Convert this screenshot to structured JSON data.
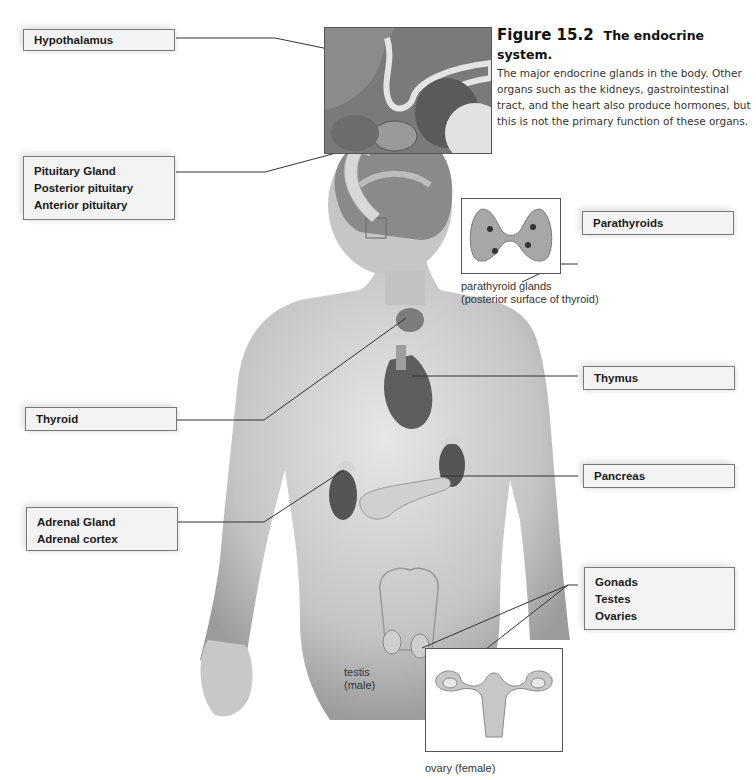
{
  "figure": {
    "number": "Figure 15.2",
    "title": "The endocrine system.",
    "description": "The major endocrine glands in the body. Other organs such as the kidneys, gastrointestinal tract, and the heart also produce hormones, but this is not the primary function of these organs."
  },
  "labels": {
    "hypothalamus": [
      "Hypothalamus"
    ],
    "pituitary": [
      "Pituitary Gland",
      "Posterior pituitary",
      "Anterior pituitary"
    ],
    "thyroid": [
      "Thyroid"
    ],
    "adrenal": [
      "Adrenal Gland",
      "Adrenal cortex"
    ],
    "parathyroids": [
      "Parathyroids"
    ],
    "thymus": [
      "Thymus"
    ],
    "pancreas": [
      "Pancreas"
    ],
    "gonads": [
      "Gonads",
      "Testes",
      "Ovaries"
    ]
  },
  "captions": {
    "parathyroid_line1": "parathyroid glands",
    "parathyroid_line2": "(posterior surface of thyroid)",
    "testis_line1": "testis",
    "testis_line2": "(male)",
    "ovary": "ovary (female)"
  },
  "colors": {
    "box_fill": "#f3f3f3",
    "box_border": "#7a7a7a",
    "leader_line": "#333333",
    "skin": "#c9c9c9",
    "organ_dark": "#6a6a6a"
  }
}
